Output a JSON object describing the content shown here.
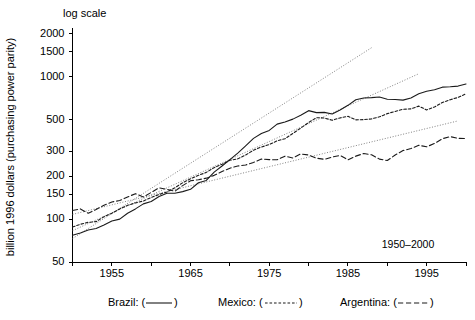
{
  "chart_data": {
    "type": "line",
    "title": "log scale",
    "xlabel": "",
    "ylabel": "billion 1996 dollars (purchasing power parity)",
    "yscale": "log",
    "ylim": [
      50,
      2200
    ],
    "xlim": [
      1950,
      2000
    ],
    "grid": false,
    "legend_position": "below-axis",
    "annotations": [
      {
        "text": "1950–2000",
        "x": 1995,
        "y": 62
      }
    ],
    "yticks": [
      50,
      100,
      150,
      200,
      300,
      500,
      1000,
      1500,
      2000
    ],
    "yticklabels": [
      "50",
      "100",
      "150",
      "200",
      "300",
      "500",
      "1000",
      "1500",
      "2000"
    ],
    "xticks": [
      1955,
      1965,
      1975,
      1985,
      1995
    ],
    "xticklabels": [
      "1955",
      "1965",
      "1975",
      "1985",
      "1995"
    ],
    "xminorticks": [
      1950,
      1960,
      1970,
      1980,
      1990,
      2000
    ],
    "x": [
      1950,
      1951,
      1952,
      1953,
      1954,
      1955,
      1956,
      1957,
      1958,
      1959,
      1960,
      1961,
      1962,
      1963,
      1964,
      1965,
      1966,
      1967,
      1968,
      1969,
      1970,
      1971,
      1972,
      1973,
      1974,
      1975,
      1976,
      1977,
      1978,
      1979,
      1980,
      1981,
      1982,
      1983,
      1984,
      1985,
      1986,
      1987,
      1988,
      1989,
      1990,
      1991,
      1992,
      1993,
      1994,
      1995,
      1996,
      1997,
      1998,
      1999,
      2000
    ],
    "series": [
      {
        "name": "Brazil",
        "legend_label": "Brazil: (——)",
        "linestyle": "solid",
        "values": [
          77,
          80,
          84,
          86,
          91,
          97,
          100,
          110,
          118,
          128,
          133,
          144,
          152,
          152,
          156,
          162,
          180,
          187,
          214,
          236,
          262,
          291,
          327,
          369,
          399,
          420,
          465,
          481,
          504,
          537,
          578,
          560,
          562,
          547,
          585,
          630,
          690,
          710,
          713,
          720,
          695,
          692,
          685,
          710,
          760,
          790,
          810,
          845,
          850,
          860,
          890
        ]
      },
      {
        "name": "Mexico",
        "legend_label": "Mexico: (- - - - -)",
        "linestyle": "dotted",
        "values": [
          88,
          92,
          95,
          96,
          104,
          110,
          118,
          125,
          130,
          134,
          142,
          149,
          155,
          166,
          180,
          192,
          203,
          213,
          230,
          243,
          259,
          265,
          282,
          305,
          321,
          334,
          355,
          367,
          400,
          436,
          477,
          516,
          513,
          495,
          514,
          527,
          498,
          500,
          506,
          523,
          551,
          571,
          591,
          595,
          622,
          585,
          614,
          659,
          690,
          716,
          760
        ]
      },
      {
        "name": "Argentina",
        "legend_label": "Argentina: (– – – –)",
        "linestyle": "dashed",
        "values": [
          115,
          118,
          110,
          117,
          125,
          132,
          135,
          143,
          151,
          143,
          154,
          166,
          162,
          157,
          172,
          186,
          189,
          194,
          203,
          216,
          228,
          236,
          240,
          250,
          264,
          262,
          261,
          277,
          269,
          287,
          282,
          268,
          263,
          273,
          280,
          261,
          277,
          289,
          283,
          264,
          258,
          282,
          303,
          313,
          330,
          322,
          340,
          367,
          380,
          369,
          368
        ]
      }
    ],
    "trendlines": [
      {
        "name": "Brazil trend",
        "x": [
          1950,
          1988
        ],
        "y": [
          73,
          1600
        ]
      },
      {
        "name": "Mexico trend",
        "x": [
          1950,
          1994
        ],
        "y": [
          83,
          1050
        ]
      },
      {
        "name": "Argentina trend",
        "x": [
          1950,
          1999
        ],
        "y": [
          108,
          490
        ]
      }
    ]
  },
  "legend": {
    "items": [
      {
        "label": "Brazil: (",
        "close": ")",
        "dash": "none"
      },
      {
        "label": "Mexico: (",
        "close": ")",
        "dash": "mexico"
      },
      {
        "label": "Argentina: (",
        "close": ")",
        "dash": "argentina"
      }
    ],
    "brazil_label": "Brazil: (",
    "mexico_label": "Mexico: (",
    "argentina_label": "Argentina: (",
    "paren_close": ")"
  }
}
